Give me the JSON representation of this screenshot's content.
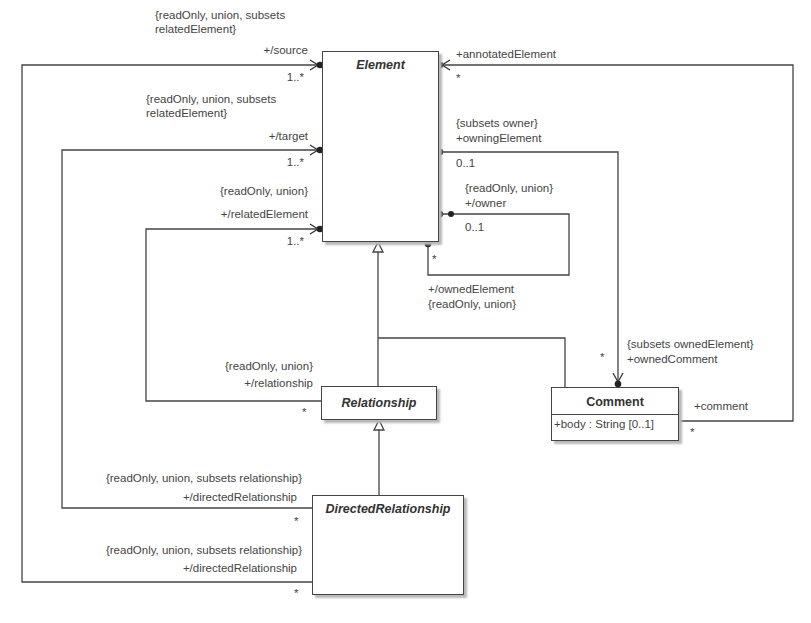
{
  "diagram": {
    "type": "UML class diagram",
    "classes": {
      "element": {
        "name": "Element",
        "abstract": true
      },
      "relationship": {
        "name": "Relationship",
        "abstract": true
      },
      "directed_relationship": {
        "name": "DirectedRelationship",
        "abstract": true
      },
      "comment": {
        "name": "Comment",
        "abstract": false,
        "attributes": [
          "+body : String [0..1]"
        ]
      }
    },
    "ends": {
      "source": {
        "constraint_line1": "{readOnly, union, subsets",
        "constraint_line2": "relatedElement}",
        "role": "+/source",
        "multiplicity": "1..*"
      },
      "target": {
        "constraint_line1": "{readOnly, union, subsets",
        "constraint_line2": "relatedElement}",
        "role": "+/target",
        "multiplicity": "1..*"
      },
      "related_element": {
        "constraint": "{readOnly, union}",
        "role": "+/relatedElement",
        "multiplicity": "1..*"
      },
      "relationship": {
        "constraint": "{readOnly, union}",
        "role": "+/relationship",
        "multiplicity": "*"
      },
      "directed_relationship_1": {
        "constraint": "{readOnly, union, subsets relationship}",
        "role": "+/directedRelationship",
        "multiplicity": "*"
      },
      "directed_relationship_2": {
        "constraint": "{readOnly, union, subsets relationship}",
        "role": "+/directedRelationship",
        "multiplicity": "*"
      },
      "annotated_element": {
        "role": "+annotatedElement",
        "multiplicity": "*"
      },
      "owning_element": {
        "constraint": "{subsets owner}",
        "role": "+owningElement",
        "multiplicity": "0..1"
      },
      "owner": {
        "constraint": "{readOnly, union}",
        "role": "+/owner",
        "multiplicity": "0..1"
      },
      "owned_element": {
        "role": "+/ownedElement",
        "constraint": "{readOnly, union}",
        "multiplicity": "*"
      },
      "owned_comment": {
        "constraint": "{subsets ownedElement}",
        "role": "+ownedComment",
        "multiplicity": "*"
      },
      "comment": {
        "role": "+comment",
        "multiplicity": "*"
      }
    }
  }
}
